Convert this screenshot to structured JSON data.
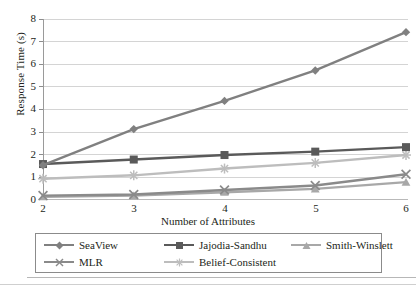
{
  "chart_data": {
    "type": "line",
    "title": "",
    "xlabel": "Number of Attributes",
    "ylabel": "Response Time (s)",
    "x": [
      2,
      3,
      4,
      5,
      6
    ],
    "xticklabels": [
      "2",
      "3",
      "4",
      "5",
      "6"
    ],
    "yticklabels": [
      "0",
      "1",
      "2",
      "3",
      "4",
      "5",
      "6",
      "7",
      "8"
    ],
    "ylim": [
      0,
      8
    ],
    "xlim": [
      2,
      6
    ],
    "grid": "horizontal",
    "legend_position": "bottom",
    "series": [
      {
        "name": "SeaView",
        "marker": "diamond",
        "color": "#808080",
        "values": [
          1.5,
          3.1,
          4.35,
          5.7,
          7.4
        ]
      },
      {
        "name": "Jajodia-Sandhu",
        "marker": "square",
        "color": "#5a5a5a",
        "values": [
          1.55,
          1.75,
          1.95,
          2.1,
          2.3
        ]
      },
      {
        "name": "Smith-Winslett",
        "marker": "triangle",
        "color": "#a8a8a8",
        "values": [
          0.1,
          0.15,
          0.3,
          0.45,
          0.75
        ]
      },
      {
        "name": "MLR",
        "marker": "x",
        "color": "#8a8a8a",
        "values": [
          0.15,
          0.2,
          0.4,
          0.6,
          1.1
        ]
      },
      {
        "name": "Belief-Consistent",
        "marker": "asterisk",
        "color": "#bdbdbd",
        "values": [
          0.9,
          1.05,
          1.35,
          1.6,
          1.95
        ]
      }
    ]
  },
  "axes": {
    "y_title": "Response Time (s)",
    "x_title": "Number of Attributes",
    "yticks": [
      "8",
      "7",
      "6",
      "5",
      "4",
      "3",
      "2",
      "1",
      "0"
    ],
    "xticks": [
      "2",
      "3",
      "4",
      "5",
      "6"
    ]
  },
  "legend": {
    "items": [
      {
        "label": "SeaView",
        "marker": "diamond-marker",
        "color": "#808080"
      },
      {
        "label": "Jajodia-Sandhu",
        "marker": "square-marker",
        "color": "#5a5a5a"
      },
      {
        "label": "Smith-Winslett",
        "marker": "triangle-marker",
        "color": "#a8a8a8"
      },
      {
        "label": "MLR",
        "marker": "x-marker",
        "color": "#8a8a8a"
      },
      {
        "label": "Belief-Consistent",
        "marker": "asterisk-marker",
        "color": "#bdbdbd"
      }
    ]
  }
}
